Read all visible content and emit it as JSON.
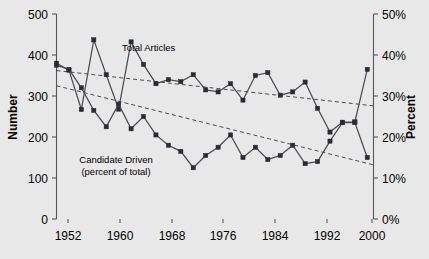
{
  "chart_data": {
    "type": "line",
    "title": "",
    "subtitle": "",
    "xlabel": "",
    "ylabel": "Number",
    "y2label": "Percent",
    "xlim": [
      1950,
      2001
    ],
    "ylim": [
      0,
      500
    ],
    "y2lim": [
      0,
      50
    ],
    "grid": false,
    "legend_position": "inline-annotation",
    "x_ticks": [
      "1952",
      "1960",
      "1968",
      "1976",
      "1984",
      "1992",
      "2000"
    ],
    "x_tick_values": [
      1952,
      1960,
      1968,
      1976,
      1984,
      1992,
      2000
    ],
    "y_ticks": [
      "0",
      "100",
      "200",
      "300",
      "400",
      "500"
    ],
    "y_tick_values": [
      0,
      100,
      200,
      300,
      400,
      500
    ],
    "y2_ticks": [
      "0%",
      "10%",
      "20%",
      "30%",
      "40%",
      "50%"
    ],
    "y2_tick_values": [
      0,
      10,
      20,
      30,
      40,
      50
    ],
    "x": [
      1950,
      1952,
      1954,
      1956,
      1958,
      1960,
      1962,
      1964,
      1966,
      1968,
      1970,
      1972,
      1974,
      1976,
      1978,
      1980,
      1982,
      1984,
      1986,
      1988,
      1990,
      1992,
      1994,
      1996,
      1998,
      2000
    ],
    "series": [
      {
        "name": "Total Articles",
        "axis": "left",
        "units": "articles",
        "label_text": "Total Articles",
        "values": [
          380,
          363,
          267,
          437,
          352,
          268,
          432,
          377,
          330,
          340,
          335,
          352,
          315,
          310,
          330,
          290,
          350,
          357,
          302,
          310,
          334,
          270,
          212,
          236,
          237,
          365
        ]
      },
      {
        "name": "Candidate Driven (percent of total)",
        "axis": "right",
        "units": "percent",
        "label_text_line1": "Candidate Driven",
        "label_text_line2": "(percent of total)",
        "values": [
          37.5,
          36.5,
          32.0,
          26.5,
          22.5,
          28.0,
          22.0,
          25.0,
          20.5,
          18.0,
          16.5,
          12.5,
          15.5,
          17.5,
          20.5,
          15.0,
          17.5,
          14.5,
          15.5,
          18.0,
          13.5,
          14.0,
          19.0,
          23.5,
          23.5,
          15.0
        ]
      }
    ],
    "trend_lines": [
      {
        "for_series": "Total Articles",
        "axis": "left",
        "start": {
          "x": 1950,
          "y": 362
        },
        "end": {
          "x": 2001,
          "y": 276
        }
      },
      {
        "for_series": "Candidate Driven (percent of total)",
        "axis": "right",
        "start": {
          "x": 1950,
          "y": 32.5
        },
        "end": {
          "x": 2001,
          "y": 13.2
        }
      }
    ],
    "colors": {
      "background": "#e8e8e8",
      "line": "#4b4b52",
      "marker": "#2b2b33",
      "trend": "#3a3a3a",
      "axis": "#555555",
      "text": "#000000"
    }
  }
}
